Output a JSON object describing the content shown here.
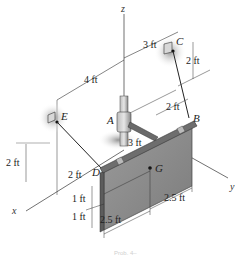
{
  "figure": {
    "type": "3D statics diagram",
    "points": {
      "A": "A",
      "B": "B",
      "C": "C",
      "D": "D",
      "E": "E",
      "G": "G"
    },
    "axes": {
      "x": "x",
      "y": "y",
      "z": "z"
    },
    "dimensions": {
      "top_3ft": "3 ft",
      "left_4ft": "4 ft",
      "c_2ft": "2 ft",
      "b_2ft": "2 ft",
      "rod_3ft": "3 ft",
      "e_2ft": "2 ft",
      "d_2ft": "2 ft",
      "plate_1ft_a": "1 ft",
      "plate_1ft_b": "1 ft",
      "right_2_5ft": "2.5 ft",
      "bottom_2_5ft": "2.5 ft"
    },
    "caption": "Prob. 4–"
  },
  "colors": {
    "plate": "#8c8c8c",
    "plate_edge": "#5a5a5a",
    "rod": "#6e6e6e",
    "support_shadow": "#9a9a9a",
    "line": "#222222"
  }
}
